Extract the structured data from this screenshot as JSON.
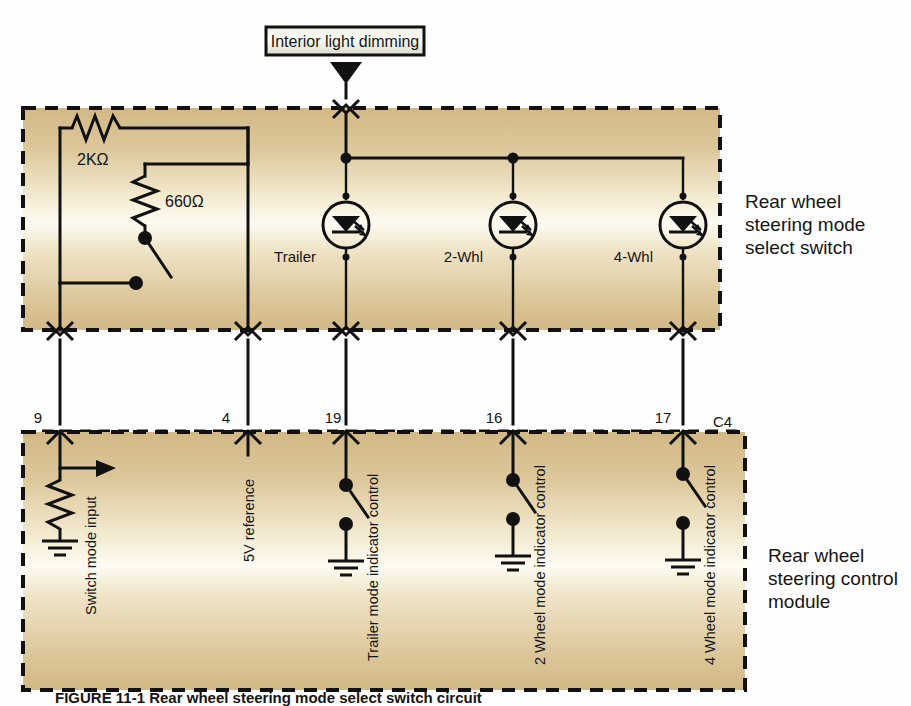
{
  "figure": {
    "caption": "FIGURE 11-1 Rear wheel steering mode select switch circuit",
    "top_source_box": "Interior light dimming"
  },
  "upper_block": {
    "title_line1": "Rear wheel",
    "title_line2": "steering mode",
    "title_line3": "select switch",
    "resistors": [
      {
        "name": "series-resistor",
        "value": "2KΩ"
      },
      {
        "name": "branch-resistor",
        "value": "660Ω"
      }
    ],
    "indicators": [
      {
        "name": "trailer-led",
        "label": "Trailer"
      },
      {
        "name": "two-wheel-led",
        "label": "2-Whl"
      },
      {
        "name": "four-wheel-led",
        "label": "4-Whl"
      }
    ]
  },
  "connector": {
    "name": "C4",
    "pins": [
      {
        "number": "9",
        "signal": "Switch mode input"
      },
      {
        "number": "4",
        "signal": "5V reference"
      },
      {
        "number": "19",
        "signal": "Trailer mode indicator control"
      },
      {
        "number": "16",
        "signal": "2 Wheel mode indicator control"
      },
      {
        "number": "17",
        "signal": "4 Wheel mode indicator control"
      }
    ]
  },
  "lower_block": {
    "title_line1": "Rear wheel",
    "title_line2": "steering control",
    "title_line3": "module"
  },
  "colors": {
    "block_fill_edge": "#d5bd8c",
    "block_fill_center": "#fdfaee",
    "wire": "#111111",
    "page_background": "#ffffff"
  }
}
